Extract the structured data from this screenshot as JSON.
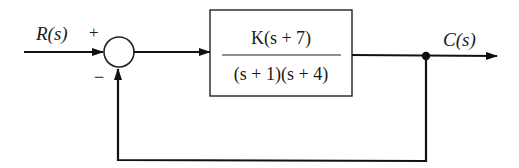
{
  "diagram": {
    "type": "closed-loop negative feedback block diagram",
    "input": {
      "label": "R(s)"
    },
    "output": {
      "label": "C(s)"
    },
    "summing_junction": {
      "plus_sign": "+",
      "minus_sign": "−"
    },
    "plant": {
      "numerator": "K(s + 7)",
      "denominator": "(s + 1)(s + 4)"
    },
    "feedback": {
      "type": "unity",
      "sign": "negative"
    },
    "colors": {
      "line": "#111111",
      "background": "#ffffff"
    }
  }
}
